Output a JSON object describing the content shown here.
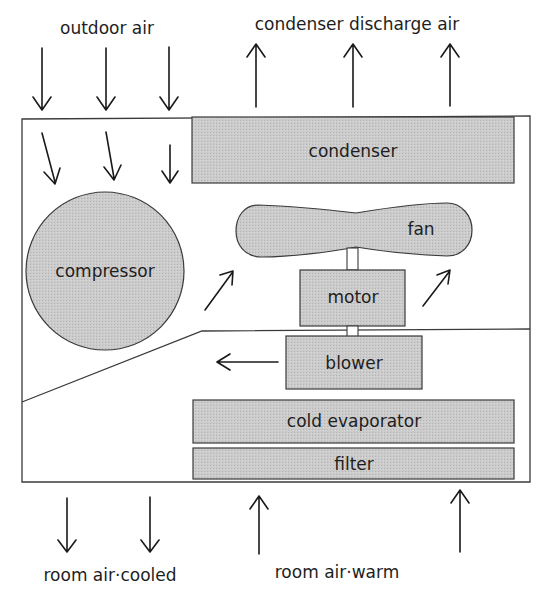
{
  "diagram": {
    "labels": {
      "outdoor_air": "outdoor air",
      "condenser_discharge_air": "condenser discharge air",
      "room_air_cooled": "room air·cooled",
      "room_air_warm": "room air·warm"
    },
    "components": {
      "condenser": "condenser",
      "compressor": "compressor",
      "fan": "fan",
      "motor": "motor",
      "blower": "blower",
      "cold_evaporator": "cold evaporator",
      "filter": "filter"
    },
    "colors": {
      "component_fill": "#c9c9c9",
      "outline": "#3a3a3a",
      "text": "#1e1e1e",
      "background": "#ffffff"
    }
  }
}
